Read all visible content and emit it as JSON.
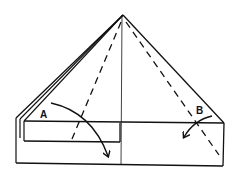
{
  "diagram": {
    "type": "origami-fold-instruction",
    "labels": {
      "a": "A",
      "b": "B"
    },
    "colors": {
      "stroke": "#111111",
      "background": "#ffffff"
    },
    "elements": [
      {
        "name": "triangle-outline",
        "description": "Folded triangle top with layered left edge"
      },
      {
        "name": "base-rectangle",
        "description": "Rectangular base band"
      },
      {
        "name": "inner-flap",
        "description": "Inner left flap rectangle"
      },
      {
        "name": "center-crease",
        "description": "Vertical center line"
      },
      {
        "name": "valley-fold-left",
        "description": "Dashed fold line, left"
      },
      {
        "name": "valley-fold-right",
        "description": "Dashed fold line, right"
      },
      {
        "name": "fold-arrow-a",
        "description": "Curved arrow from A folding down-right"
      },
      {
        "name": "fold-arrow-b",
        "description": "Curved arrow from B folding down-left"
      }
    ]
  }
}
